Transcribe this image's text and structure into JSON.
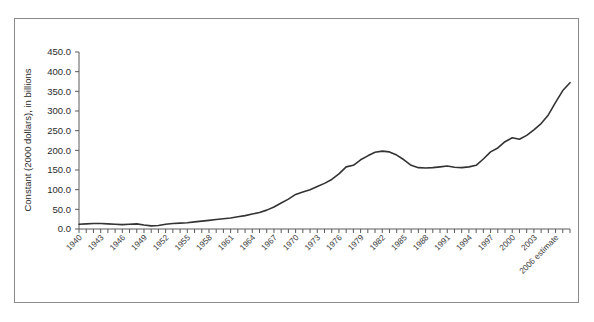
{
  "chart_data": {
    "type": "line",
    "title": "",
    "xlabel": "",
    "ylabel": "Constant (2000 dollars), in billions",
    "ylim": [
      0,
      450
    ],
    "ytick_labels": [
      "0.0",
      "50.0",
      "100.0",
      "150.0",
      "200.0",
      "250.0",
      "300.0",
      "350.0",
      "400.0",
      "450.0"
    ],
    "ytick_values": [
      0,
      50,
      100,
      150,
      200,
      250,
      300,
      350,
      400,
      450
    ],
    "grid": false,
    "legend": "none",
    "line_color": "#333333",
    "frame_color": "#8a8a8a",
    "xtick_labels_shown": [
      "1940",
      "1943",
      "1946",
      "1949",
      "1952",
      "1955",
      "1958",
      "1961",
      "1964",
      "1967",
      "1970",
      "1973",
      "1976",
      "1979",
      "1982",
      "1985",
      "1988",
      "1991",
      "1994",
      "1997",
      "2000",
      "2003",
      "2006 estimate",
      "2008 estimate"
    ],
    "categories": [
      "1940",
      "1941",
      "1942",
      "1943",
      "1944",
      "1945",
      "1946",
      "1947",
      "1948",
      "1949",
      "1950",
      "1951",
      "1952",
      "1953",
      "1954",
      "1955",
      "1956",
      "1957",
      "1958",
      "1959",
      "1960",
      "1961",
      "1962",
      "1963",
      "1964",
      "1965",
      "1966",
      "1967",
      "1968",
      "1969",
      "1970",
      "1971",
      "1972",
      "1973",
      "1974",
      "1975",
      "1976",
      "1977",
      "1978",
      "1979",
      "1980",
      "1981",
      "1982",
      "1983",
      "1984",
      "1985",
      "1986",
      "1987",
      "1988",
      "1989",
      "1990",
      "1991",
      "1992",
      "1993",
      "1994",
      "1995",
      "1996",
      "1997",
      "1998",
      "1999",
      "2000",
      "2001",
      "2002",
      "2003",
      "2004",
      "2005",
      "2006 estimate",
      "2007",
      "2008 estimate"
    ],
    "values": [
      12,
      13,
      14,
      14,
      13,
      12,
      11,
      12,
      13,
      10,
      8,
      9,
      12,
      14,
      15,
      16,
      18,
      20,
      22,
      24,
      26,
      28,
      31,
      34,
      38,
      42,
      48,
      56,
      66,
      76,
      88,
      94,
      100,
      108,
      116,
      126,
      140,
      158,
      162,
      176,
      186,
      195,
      198,
      196,
      188,
      176,
      162,
      156,
      155,
      156,
      158,
      160,
      157,
      156,
      158,
      162,
      178,
      196,
      206,
      222,
      232,
      228,
      238,
      252,
      268,
      290,
      322,
      352,
      372
    ],
    "values_note": "Read from the plotted line against the 0-450 axis"
  },
  "axis": {
    "ylabel": "Constant (2000 dollars), in billions"
  }
}
